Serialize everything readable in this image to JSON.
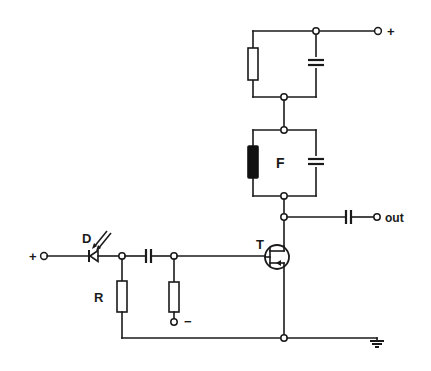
{
  "diagram": {
    "type": "circuit-schematic",
    "labels": {
      "supply_plus_top": "+",
      "input_plus": "+",
      "photodiode": "D",
      "resistor": "R",
      "bias_minus": "−",
      "transistor": "T",
      "filter": "F",
      "output": "out"
    },
    "components": [
      {
        "id": "D",
        "kind": "photodiode",
        "label": "D"
      },
      {
        "id": "R",
        "kind": "resistor",
        "label": "R"
      },
      {
        "id": "C_coupling_in",
        "kind": "capacitor"
      },
      {
        "id": "R_bias",
        "kind": "resistor"
      },
      {
        "id": "T",
        "kind": "JFET transistor",
        "label": "T"
      },
      {
        "id": "F",
        "kind": "crystal filter with parallel capacitor",
        "label": "F"
      },
      {
        "id": "R_load",
        "kind": "resistor (parallel with capacitor)"
      },
      {
        "id": "C_out",
        "kind": "capacitor"
      },
      {
        "id": "GND",
        "kind": "ground"
      }
    ],
    "terminals": [
      "+ (supply, top right)",
      "+ (input, left)",
      "− (bias)",
      "out",
      "ground"
    ]
  }
}
